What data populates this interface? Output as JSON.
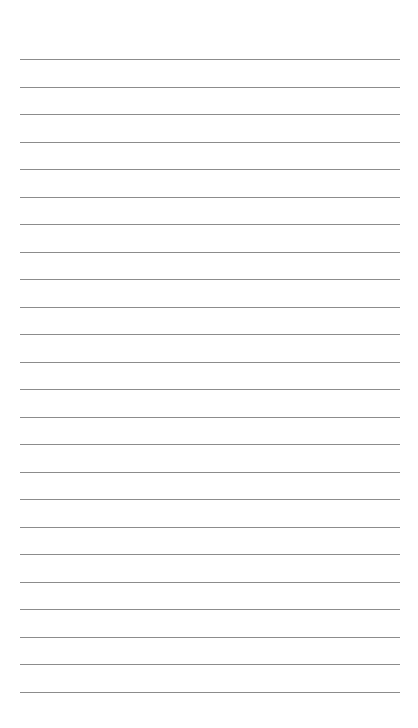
{
  "page": {
    "type": "lined-sheet",
    "background_color": "#ffffff",
    "rule_color": "#8c8c8c",
    "rule_count": 24,
    "first_rule_y": 59,
    "rule_spacing": 27.5,
    "rule_left": 20,
    "rule_right": 400,
    "text_content": []
  }
}
